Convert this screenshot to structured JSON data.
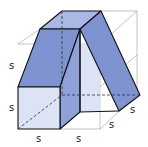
{
  "diagram": {
    "labels": {
      "left_upper": "s",
      "left_lower": "s",
      "bottom_left": "s",
      "bottom_mid": "s",
      "bottom_right_depth1": "s",
      "bottom_right_depth2": "s"
    },
    "colors": {
      "dark_face": "#7f93d0",
      "mid_face": "#a9b8e4",
      "light_face": "#dbe3f5",
      "edge": "#111111",
      "box_edge": "#9a9a9a"
    }
  }
}
